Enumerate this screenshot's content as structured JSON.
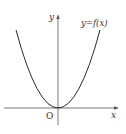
{
  "diagram": {
    "type": "function-graph",
    "curve_label": "y=f(x)",
    "axis_labels": {
      "x": "x",
      "y": "y",
      "origin": "O"
    },
    "curve": {
      "shape": "parabola",
      "vertex": [
        0,
        0
      ],
      "opens": "up"
    },
    "colors": {
      "axis": "#555555",
      "curve": "#2a2a2a",
      "text": "#333333"
    }
  }
}
